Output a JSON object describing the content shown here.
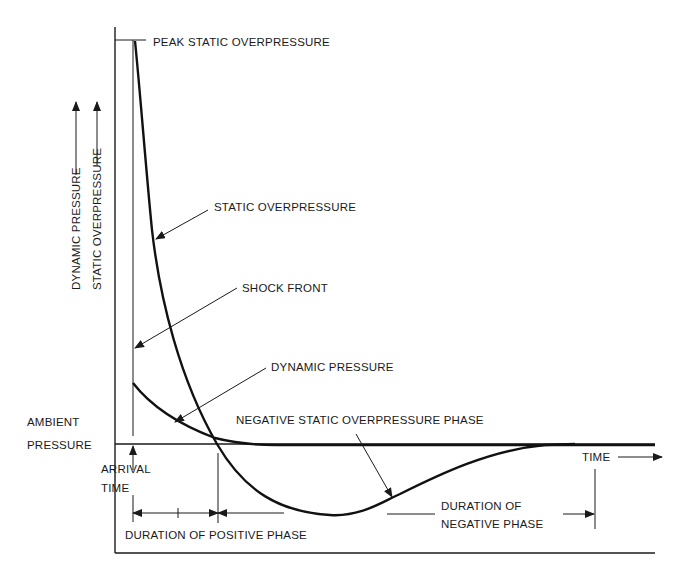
{
  "diagram": {
    "type": "blast-wave pressure-time curve",
    "axis_labels": {
      "y_outer": "DYNAMIC PRESSURE",
      "y_inner": "STATIC OVERPRESSURE",
      "x": "TIME"
    },
    "labels": {
      "peak": "PEAK STATIC OVERPRESSURE",
      "static_curve": "STATIC OVERPRESSURE",
      "shock_front": "SHOCK FRONT",
      "dynamic_curve": "DYNAMIC PRESSURE",
      "negative_phase": "NEGATIVE STATIC OVERPRESSURE PHASE",
      "ambient_line1": "AMBIENT",
      "ambient_line2": "PRESSURE",
      "arrival_line1": "ARRIVAL",
      "arrival_line2": "TIME",
      "positive_duration": "DURATION OF POSITIVE PHASE",
      "negative_duration_line1": "DURATION OF",
      "negative_duration_line2": "NEGATIVE PHASE"
    },
    "colors": {
      "ink": "#1a1a1a",
      "background": "#ffffff"
    }
  }
}
